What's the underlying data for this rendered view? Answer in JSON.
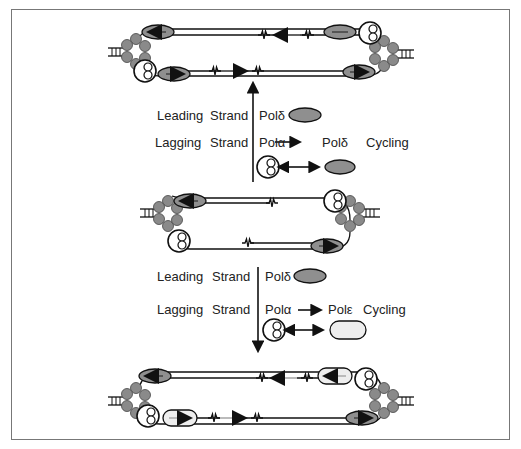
{
  "diagram": {
    "type": "DNA replication fork schematic",
    "states": [
      {
        "id": "top",
        "description": "Pol delta cycling on lagging strand; Pol delta on leading strand"
      },
      {
        "id": "middle",
        "description": "Initial replication bubble with Pol alpha primase and Pol delta on leading strand"
      },
      {
        "id": "bottom",
        "description": "Pol epsilon cycling on lagging strand; Pol delta on leading strand"
      }
    ],
    "transitions": [
      {
        "direction": "up",
        "leading": {
          "label": "Leading",
          "strand": "Strand",
          "polymerase": "Polδ"
        },
        "lagging": {
          "label": "Lagging",
          "strand": "Strand",
          "from": "Polα",
          "to": "Polδ",
          "mode": "Cycling"
        }
      },
      {
        "direction": "down",
        "leading": {
          "label": "Leading",
          "strand": "Strand",
          "polymerase": "Polδ"
        },
        "lagging": {
          "label": "Lagging",
          "strand": "Strand",
          "from": "Polα",
          "to": "Polε",
          "mode": "Cycling"
        }
      }
    ],
    "colors": {
      "frame": "#777777",
      "strand": "#222222",
      "pol_delta": "#8f8f8f",
      "pol_epsilon": "#eeeeee",
      "helicase": "#8a8a8a",
      "arrow_dark": "#666666",
      "arrow_light": "#bbbbbb"
    }
  }
}
